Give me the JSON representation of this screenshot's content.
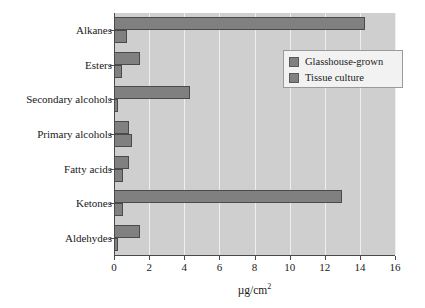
{
  "chart_data": {
    "type": "bar",
    "orientation": "horizontal",
    "title": "",
    "xlabel": "µg/cm²",
    "ylabel": "",
    "xlim": [
      0,
      16
    ],
    "xticks": [
      0,
      2,
      4,
      6,
      8,
      10,
      12,
      14,
      16
    ],
    "xtick_labels": [
      "0",
      "2",
      "4",
      "6",
      "8",
      "10",
      "12",
      "14",
      "16"
    ],
    "grid": true,
    "grid_axis": "x",
    "legend_position": "upper right",
    "categories": [
      "Alkanes",
      "Esters",
      "Secondary alcohols",
      "Primary alcohols",
      "Fatty acids",
      "Ketones",
      "Aldehydes"
    ],
    "series": [
      {
        "name": "Glasshouse-grown",
        "color": "#808080",
        "values": [
          14.3,
          1.5,
          4.3,
          0.85,
          0.85,
          13.0,
          1.5
        ]
      },
      {
        "name": "Tissue culture",
        "color": "#808080",
        "values": [
          0.75,
          0.45,
          0.2,
          1.05,
          0.5,
          0.5,
          0.25
        ]
      }
    ]
  },
  "axis": {
    "x_title_main": "µg/cm",
    "x_title_sup": "2"
  },
  "legend": {
    "entries": [
      {
        "label": "Glasshouse-grown",
        "swatch_name": "legend-swatch-glasshouse-grown"
      },
      {
        "label": "Tissue culture",
        "swatch_name": "legend-swatch-tissue-culture"
      }
    ]
  },
  "colors": {
    "bar_fill": "#808080",
    "bar_edge": "#4a4a4a",
    "plot_background": "#cfcfcf",
    "gridline": "#efefef",
    "legend_background": "#f2f2f2",
    "axis_line": "#4a4a4a",
    "text": "#1a1a1a",
    "figure_background": "#ffffff"
  }
}
